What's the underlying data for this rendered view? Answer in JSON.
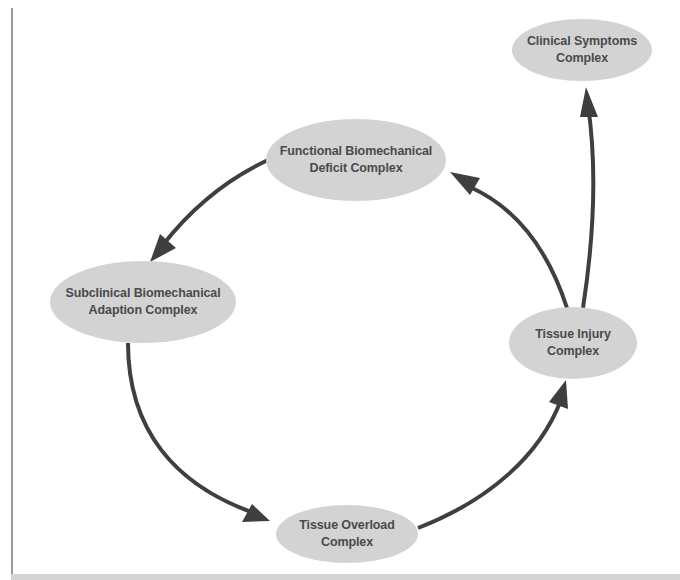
{
  "diagram": {
    "type": "cycle-flow",
    "colors": {
      "node_fill": "#d3d3d3",
      "node_text": "#4a4a4a",
      "arrow": "#3f3f3f",
      "background": "#ffffff"
    },
    "nodes": [
      {
        "id": "clinical",
        "line1": "Clinical Symptoms",
        "line2": "Complex"
      },
      {
        "id": "functional",
        "line1": "Functional Biomechanical",
        "line2": "Deficit Complex"
      },
      {
        "id": "subclinical",
        "line1": "Subclinical Biomechanical",
        "line2": "Adaption Complex"
      },
      {
        "id": "injury",
        "line1": "Tissue Injury",
        "line2": "Complex"
      },
      {
        "id": "overload",
        "line1": "Tissue Overload",
        "line2": "Complex"
      }
    ],
    "edges": [
      {
        "from": "functional",
        "to": "subclinical"
      },
      {
        "from": "subclinical",
        "to": "overload"
      },
      {
        "from": "overload",
        "to": "injury"
      },
      {
        "from": "injury",
        "to": "functional"
      },
      {
        "from": "injury",
        "to": "clinical"
      }
    ]
  }
}
